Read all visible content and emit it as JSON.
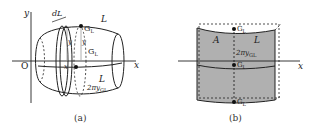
{
  "figure_a": {
    "caption": "(a)",
    "axis_x": "x",
    "axis_y": "y",
    "origin": "O",
    "dL": "dL",
    "L_top": "L",
    "L_bottom": "L",
    "G_top": "G",
    "G_top_sub": "L",
    "G_mid": "G",
    "G_mid_sub": "L",
    "y_left": "y",
    "y_right": "y",
    "x_mark": "x",
    "circumference": "2πy",
    "circumference_sub": "GL"
  },
  "figure_b": {
    "caption": "(b)",
    "axis_x": "x",
    "A": "A",
    "L": "L",
    "G_top": "G",
    "G_top_sub": "L",
    "G_mid": "G",
    "G_mid_sub": "L",
    "G_bot": "G",
    "G_bot_sub": "L",
    "circumference": "2πy",
    "circumference_sub": "GL",
    "fill_color": "#b0b0b0"
  }
}
